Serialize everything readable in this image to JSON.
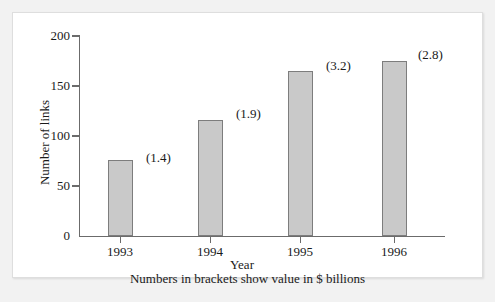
{
  "chart_data": {
    "type": "bar",
    "title": "",
    "xlabel": "Year",
    "ylabel": "Number of links",
    "categories": [
      "1993",
      "1994",
      "1995",
      "1996"
    ],
    "values": [
      76,
      116,
      165,
      175
    ],
    "point_labels": [
      "(1.4)",
      "(1.9)",
      "(3.2)",
      "(2.8)"
    ],
    "point_label_values": [
      1.4,
      1.9,
      3.2,
      2.8
    ],
    "series": [
      {
        "name": "Number of links",
        "values": [
          76,
          116,
          165,
          175
        ]
      }
    ],
    "ylim": [
      0,
      200
    ],
    "ytick_labels": [
      "0",
      "50",
      "100",
      "150",
      "200"
    ],
    "ytick_values": [
      0,
      50,
      100,
      150,
      200
    ],
    "xtick_labels": [
      "1993",
      "1994",
      "1995",
      "1996"
    ],
    "grid": false,
    "legend": false,
    "legend_position": "none",
    "footnote": "Numbers in brackets show value in $ billions",
    "colors": {
      "bar_fill": "#c9c9c9",
      "bar_stroke": "#7d7d7d",
      "axis": "#6b6b6b",
      "text": "#1a1a1a",
      "panel_background": "#ffffff",
      "page_background": "#f2f2f2"
    }
  }
}
